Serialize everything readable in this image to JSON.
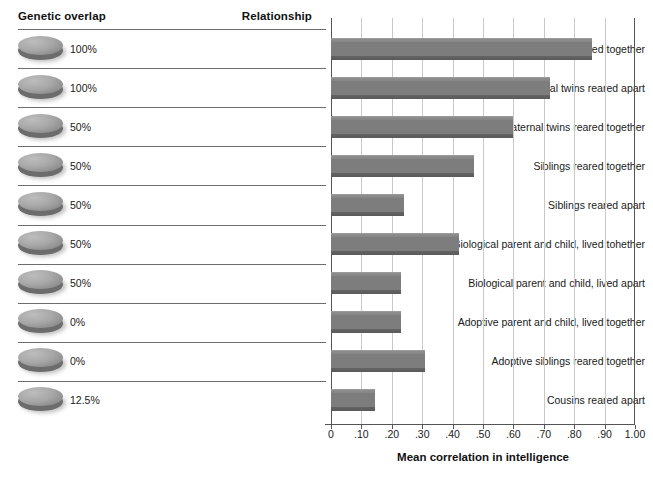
{
  "headers": {
    "genetic_overlap": "Genetic overlap",
    "relationship": "Relationship"
  },
  "rows": [
    {
      "genetic_overlap": "100%",
      "relationship": "Identical twins reared together",
      "value": 0.86
    },
    {
      "genetic_overlap": "100%",
      "relationship": "Identical twins reared apart",
      "value": 0.72
    },
    {
      "genetic_overlap": "50%",
      "relationship": "Fraternal twins reared together",
      "value": 0.6
    },
    {
      "genetic_overlap": "50%",
      "relationship": "Siblings reared together",
      "value": 0.47
    },
    {
      "genetic_overlap": "50%",
      "relationship": "Siblings reared apart",
      "value": 0.24
    },
    {
      "genetic_overlap": "50%",
      "relationship": "Biological parent and child, lived tohether",
      "value": 0.42
    },
    {
      "genetic_overlap": "50%",
      "relationship": "Biological parent and child, lived apart",
      "value": 0.23
    },
    {
      "genetic_overlap": "0%",
      "relationship": "Adoptive parent and child, lived together",
      "value": 0.23
    },
    {
      "genetic_overlap": "0%",
      "relationship": "Adoptive siblings reared together",
      "value": 0.31
    },
    {
      "genetic_overlap": "12.5%",
      "relationship": "Cousins reared apart",
      "value": 0.145
    }
  ],
  "axis": {
    "title": "Mean correlation in intelligence",
    "tick_labels": [
      "0",
      ".10",
      ".20",
      ".30",
      ".40",
      ".50",
      ".60",
      ".70",
      ".80",
      ".90",
      "1.00"
    ],
    "tick_values": [
      0,
      0.1,
      0.2,
      0.3,
      0.4,
      0.5,
      0.6,
      0.7,
      0.8,
      0.9,
      1.0
    ],
    "min": 0,
    "max": 1.0
  },
  "colors": {
    "bar": "#7d7d7d",
    "bar_edge": "#5a5a5a",
    "gridline": "#c9c9c9",
    "axis": "#555555",
    "separator": "#6d6d6d",
    "text": "#1a1a1a"
  },
  "chart_data": {
    "type": "bar",
    "orientation": "horizontal",
    "title": "",
    "xlabel": "Mean correlation in intelligence",
    "ylabel": "Relationship",
    "xlim": [
      0,
      1.0
    ],
    "grid": true,
    "legend": "none",
    "categories": [
      "Identical twins reared together",
      "Identical twins reared apart",
      "Fraternal twins reared together",
      "Siblings reared together",
      "Siblings reared apart",
      "Biological parent and child, lived tohether",
      "Biological parent and child, lived apart",
      "Adoptive parent and child, lived together",
      "Adoptive siblings reared together",
      "Cousins reared apart"
    ],
    "values": [
      0.86,
      0.72,
      0.6,
      0.47,
      0.24,
      0.42,
      0.23,
      0.23,
      0.31,
      0.145
    ],
    "genetic_overlap": [
      "100%",
      "100%",
      "50%",
      "50%",
      "50%",
      "50%",
      "50%",
      "0%",
      "0%",
      "12.5%"
    ],
    "xticks": [
      0,
      0.1,
      0.2,
      0.3,
      0.4,
      0.5,
      0.6,
      0.7,
      0.8,
      0.9,
      1.0
    ],
    "xticklabels": [
      "0",
      ".10",
      ".20",
      ".30",
      ".40",
      ".50",
      ".60",
      ".70",
      ".80",
      ".90",
      "1.00"
    ]
  }
}
